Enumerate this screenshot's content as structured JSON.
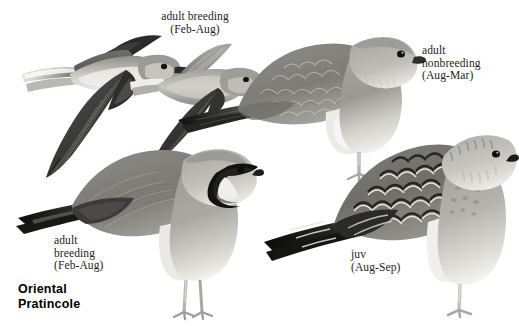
{
  "plate": {
    "background_color": "#ffffff",
    "width": 519,
    "height": 326,
    "species_name_line1": "Oriental",
    "species_name_line2": "Pratincole"
  },
  "palette": {
    "text": "#1c1c1c",
    "species_text": "#000000",
    "plumage_dark": "#1a1a1a",
    "plumage_mid_dark": "#4f4f4f",
    "plumage_mid": "#8b8b87",
    "plumage_light": "#bdbcb7",
    "plumage_pale": "#e3e1dc",
    "plumage_white": "#f7f6f3",
    "bill_dark": "#2a2a2a",
    "leg": "#b4b3ae"
  },
  "figures": [
    {
      "id": "flying-adult-breeding-underside",
      "name": "flying-adult-breeding-underside",
      "label_lines": [
        "adult breeding",
        "(Feb-Aug)"
      ],
      "label_align": "center",
      "label_x": 143,
      "label_y": 10,
      "pose": "flight",
      "view": "underside"
    },
    {
      "id": "flying-adult-breeding-upperside",
      "name": "flying-adult-breeding-upperside",
      "label_lines": [],
      "pose": "flight",
      "view": "upperside"
    },
    {
      "id": "standing-adult-nonbreeding",
      "name": "standing-adult-nonbreeding",
      "label_lines": [
        "adult",
        "nonbreeding",
        "(Aug-Mar)"
      ],
      "label_align": "left",
      "label_x": 422,
      "label_y": 44,
      "pose": "standing",
      "view": "side"
    },
    {
      "id": "standing-adult-breeding",
      "name": "standing-adult-breeding",
      "label_lines": [
        "adult",
        "breeding",
        "(Feb-Aug)"
      ],
      "label_align": "left",
      "label_x": 54,
      "label_y": 234,
      "pose": "standing",
      "view": "side"
    },
    {
      "id": "standing-juvenile",
      "name": "standing-juvenile",
      "label_lines": [
        "juv",
        "(Aug-Sep)"
      ],
      "label_align": "left",
      "label_x": 351,
      "label_y": 248,
      "pose": "standing",
      "view": "side"
    }
  ],
  "labels": {
    "top_flight": "adult breeding\n(Feb-Aug)",
    "adult_nonbreeding": "adult\nnonbreeding\n(Aug-Mar)",
    "adult_breeding_standing": "adult\nbreeding\n(Feb-Aug)",
    "juvenile": "juv\n(Aug-Sep)"
  }
}
